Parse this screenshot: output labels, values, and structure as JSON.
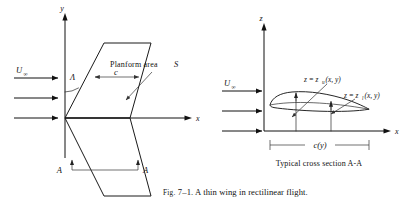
{
  "figure": {
    "caption_label": "Fig.",
    "caption_number": "7–1.",
    "caption_text": "A thin wing in rectilinear flight.",
    "background_color": "#ffffff",
    "ink_color": "#111111"
  },
  "left_panel": {
    "name": "wing-planform-view",
    "axis_vertical_label": "y",
    "axis_horizontal_label": "x",
    "freestream_label": "U",
    "freestream_subscript": "∞",
    "sweep_angle_label": "Λ",
    "chord_label": "c",
    "planform_area_label": "Planform area",
    "planform_area_symbol": "S",
    "section_marker_left": "A",
    "section_marker_right": "A",
    "flow_arrow_count": 3
  },
  "right_panel": {
    "name": "airfoil-cross-section-view",
    "axis_vertical_label": "z",
    "axis_horizontal_label": "x",
    "freestream_label": "U",
    "freestream_subscript": "∞",
    "upper_surface_eq": "z = z",
    "upper_surface_sub": "u",
    "upper_surface_args": "(x, y)",
    "lower_surface_eq": "z = z",
    "lower_surface_sub": "l",
    "lower_surface_args": "(x, y)",
    "chord_label": "c(y)",
    "section_caption": "Typical cross section A-A",
    "flow_arrow_count": 3
  }
}
